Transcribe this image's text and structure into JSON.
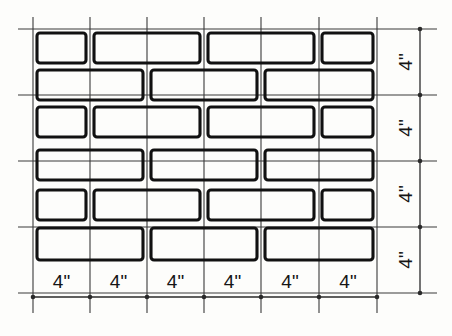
{
  "figure": {
    "type": "technical-drawing",
    "colors": {
      "paper": "#fdfdfb",
      "brick_outline": "#111111",
      "grid_line": "#3a3a3a",
      "dimension_line": "#2a2a2a",
      "text": "#151515"
    }
  },
  "grid": {
    "module_label": "4\"",
    "columns": 6,
    "rows": 4,
    "x_lines": [
      33,
      90,
      147,
      204,
      261,
      319,
      377
    ],
    "y_lines": [
      29,
      95,
      161,
      227,
      293
    ],
    "field": {
      "left": 33,
      "top": 29,
      "right": 377,
      "bottom": 293
    },
    "extend_left": 18,
    "extend_right": 437,
    "extend_top": 17,
    "extend_bottom": 313
  },
  "bottom_dimensions": {
    "axis_y": 297,
    "labels": [
      "4\"",
      "4\"",
      "4\"",
      "4\"",
      "4\"",
      "4\""
    ],
    "tick_x": [
      33,
      90,
      147,
      204,
      261,
      319,
      377
    ],
    "label_y": 288
  },
  "right_dimensions": {
    "axis_x": 420,
    "labels": [
      "4\"",
      "4\"",
      "4\"",
      "4\""
    ],
    "tick_y": [
      29,
      95,
      161,
      227,
      293
    ],
    "label_x": 405
  },
  "courses": [
    {
      "name": "course-1",
      "y": 33,
      "height": 30,
      "bricks": [
        {
          "x": 37,
          "w": 49,
          "type": "half"
        },
        {
          "x": 94,
          "w": 106,
          "type": "full"
        },
        {
          "x": 208,
          "w": 106,
          "type": "full"
        },
        {
          "x": 322,
          "w": 51,
          "type": "half"
        }
      ]
    },
    {
      "name": "course-2",
      "y": 70,
      "height": 30,
      "bricks": [
        {
          "x": 37,
          "w": 106,
          "type": "full"
        },
        {
          "x": 151,
          "w": 106,
          "type": "full"
        },
        {
          "x": 265,
          "w": 108,
          "type": "full"
        }
      ]
    },
    {
      "name": "course-3",
      "y": 107,
      "height": 30,
      "bricks": [
        {
          "x": 37,
          "w": 49,
          "type": "half"
        },
        {
          "x": 94,
          "w": 106,
          "type": "full"
        },
        {
          "x": 208,
          "w": 106,
          "type": "full"
        },
        {
          "x": 322,
          "w": 51,
          "type": "half"
        }
      ]
    },
    {
      "name": "course-4",
      "y": 150,
      "height": 30,
      "bricks": [
        {
          "x": 37,
          "w": 106,
          "type": "full"
        },
        {
          "x": 151,
          "w": 106,
          "type": "full"
        },
        {
          "x": 265,
          "w": 108,
          "type": "full"
        }
      ]
    },
    {
      "name": "course-5",
      "y": 190,
      "height": 30,
      "bricks": [
        {
          "x": 37,
          "w": 49,
          "type": "half"
        },
        {
          "x": 94,
          "w": 106,
          "type": "full"
        },
        {
          "x": 208,
          "w": 106,
          "type": "full"
        },
        {
          "x": 322,
          "w": 51,
          "type": "half"
        }
      ]
    },
    {
      "name": "course-6",
      "y": 228,
      "height": 32,
      "bricks": [
        {
          "x": 37,
          "w": 106,
          "type": "full"
        },
        {
          "x": 151,
          "w": 106,
          "type": "full"
        },
        {
          "x": 265,
          "w": 108,
          "type": "full"
        }
      ]
    }
  ]
}
